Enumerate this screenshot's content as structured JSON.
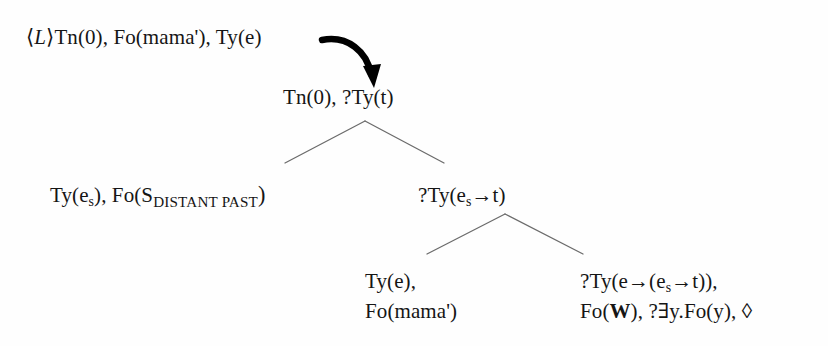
{
  "figure": {
    "kind": "dynamic-syntax-parse-tree",
    "background_color": "#fefefe",
    "ink_color": "#151515",
    "edge_color": "#6b6b6b",
    "arrow_color": "#000000"
  },
  "nodes": {
    "root_annotation": {
      "bracket_open": "⟨",
      "modality_label": "L",
      "bracket_close": "⟩",
      "text": "Tn(0), Fo(mama'), Ty(e)"
    },
    "root": {
      "text": "Tn(0), ?Ty(t)"
    },
    "left_daughter": {
      "prefix": "Ty(e",
      "subscript": "s",
      "middle": "), Fo(S",
      "subscript_smallcaps": "DISTANT PAST",
      "suffix": ")"
    },
    "right_daughter": {
      "prefix": "?Ty(e",
      "subscript": "s",
      "suffix": "→t)"
    },
    "leaf_left": {
      "line1": "Ty(e),",
      "line2": "Fo(mama')"
    },
    "leaf_right": {
      "line1_prefix": "?Ty(e→(e",
      "line1_subscript": "s",
      "line1_suffix": "→t)),",
      "line2_prefix": "Fo(",
      "line2_bold": "W",
      "line2_suffix": "), ?∃y.Fo(y), ◊"
    }
  },
  "edges": [
    {
      "name": "branch-1-left",
      "x1": 365,
      "y1": 121,
      "x2": 285,
      "y2": 163
    },
    {
      "name": "branch-1-right",
      "x1": 365,
      "y1": 121,
      "x2": 444,
      "y2": 163
    },
    {
      "name": "branch-2-left",
      "x1": 505,
      "y1": 214,
      "x2": 427,
      "y2": 254
    },
    {
      "name": "branch-2-right",
      "x1": 505,
      "y1": 214,
      "x2": 583,
      "y2": 254
    }
  ],
  "arrow": {
    "name": "development-arrow",
    "path": "M 322 40 C 348 35, 367 52, 371 74",
    "head": "M 363 66 L 374 88 L 381 64 Z"
  }
}
